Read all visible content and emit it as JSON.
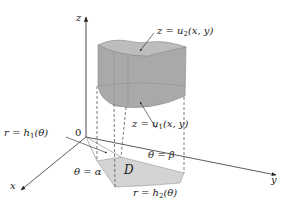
{
  "figure": {
    "axes": {
      "x_label": "x",
      "y_label": "y",
      "z_label": "z",
      "origin_label": "0"
    },
    "labels": {
      "top_surface": {
        "prefix": "z = u",
        "sub": "2",
        "suffix": "(x, y)"
      },
      "bottom_surface": {
        "prefix": "z = u",
        "sub": "1",
        "suffix": "(x, y)"
      },
      "inner_curve": {
        "prefix": "r = h",
        "sub": "1",
        "suffix": "(θ)"
      },
      "outer_curve": {
        "prefix": "r = h",
        "sub": "2",
        "suffix": "(θ)"
      },
      "theta_alpha": "θ = α",
      "theta_beta": "θ = β",
      "region": "D"
    },
    "colors": {
      "solid_fill": "#a9a9a9",
      "solid_top": "#bdbdbd",
      "region_fill": "#d4d4d4",
      "axis": "#333333",
      "dashed": "#444444"
    }
  }
}
